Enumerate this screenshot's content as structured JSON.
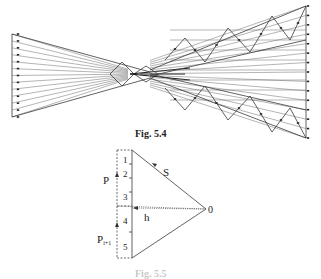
{
  "figure_top": {
    "caption": "Fig. 5.4",
    "description": "Truss force diagram (Cremona/Maxwell diagram) with converging load lines and zigzag web members"
  },
  "figure_bottom": {
    "caption": "Fig. 5.5",
    "labels": {
      "load_upper": "P",
      "load_lower": "P",
      "load_lower_subscript": "i+1",
      "segment_1": "1",
      "segment_2": "2",
      "segment_3": "3",
      "segment_4": "4",
      "segment_5": "5",
      "member": "S",
      "horizontal": "h",
      "pole": "0"
    }
  }
}
